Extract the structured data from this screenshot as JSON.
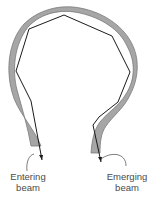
{
  "diagram": {
    "type": "optical-fiber-total-internal-reflection",
    "colors": {
      "fiber_fill": "#a6a6a6",
      "fiber_edge": "#7a7a7a",
      "ray": "#1a1a1a",
      "label_text": "#4a4a4a",
      "background": "#ffffff"
    },
    "labels": {
      "entering_line1": "Entering",
      "entering_line2": "beam",
      "emerging_line1": "Emerging",
      "emerging_line2": "beam"
    }
  }
}
